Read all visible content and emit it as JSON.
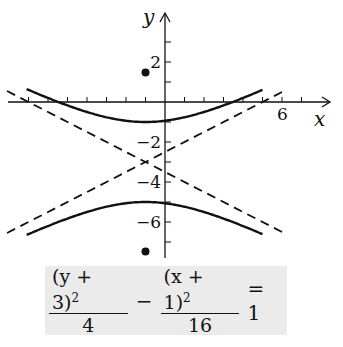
{
  "chart_data": {
    "type": "line",
    "title": "",
    "xlabel": "x",
    "ylabel": "y",
    "equation": {
      "numerator_left": "(y + 3)",
      "exp_left": "2",
      "denominator_left": "4",
      "minus": "−",
      "numerator_right": "(x + 1)",
      "exp_right": "2",
      "denominator_right": "16",
      "equals": "= 1"
    },
    "tick_labels": {
      "x": [
        {
          "value": 6,
          "label": "6"
        }
      ],
      "y": [
        {
          "value": 2,
          "label": "2"
        },
        {
          "value": -2,
          "label": "−2"
        },
        {
          "value": -4,
          "label": "−4"
        },
        {
          "value": -6,
          "label": "−6"
        }
      ]
    },
    "xlim": [
      -7,
      8.5
    ],
    "ylim": [
      -8,
      5
    ],
    "grid": false,
    "hyperbola": {
      "center": [
        -1,
        -3
      ],
      "a": 2,
      "b": 4,
      "vertices": [
        [
          -1,
          -1
        ],
        [
          -1,
          -5
        ]
      ],
      "orientation": "vertical"
    },
    "foci": [
      [
        -1,
        1.47
      ],
      [
        -1,
        -7.47
      ]
    ],
    "asymptotes": [
      {
        "name": "y + 3 = (1/2)(x + 1)",
        "slope": 0.5,
        "style": "dashed"
      },
      {
        "name": "y + 3 = -(1/2)(x + 1)",
        "slope": -0.5,
        "style": "dashed"
      }
    ],
    "series": [
      {
        "name": "upper branch",
        "x_range": [
          -7,
          5
        ],
        "style": "solid"
      },
      {
        "name": "lower branch",
        "x_range": [
          -7,
          5
        ],
        "style": "solid"
      }
    ]
  },
  "axes": {
    "x_label": "x",
    "y_label": "y"
  }
}
